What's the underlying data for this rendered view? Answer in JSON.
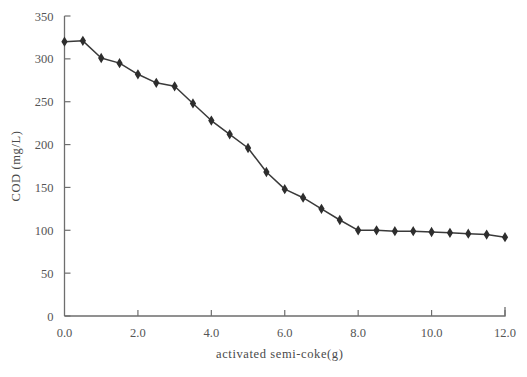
{
  "chart_data": {
    "type": "line",
    "title": "",
    "xlabel": "activated semi-coke(g)",
    "ylabel": "COD (mg/L)",
    "xlim": [
      0.0,
      12.0
    ],
    "ylim": [
      0,
      350
    ],
    "xticks": [
      "0.0",
      "2.0",
      "4.0",
      "6.0",
      "8.0",
      "10.0",
      "12.0"
    ],
    "xtick_values": [
      0.0,
      2.0,
      4.0,
      6.0,
      8.0,
      10.0,
      12.0
    ],
    "yticks": [
      "0",
      "50",
      "100",
      "150",
      "200",
      "250",
      "300",
      "350"
    ],
    "ytick_values": [
      0,
      50,
      100,
      150,
      200,
      250,
      300,
      350
    ],
    "grid": false,
    "legend": "none",
    "marker": "diamond",
    "line_color": "#3a3a3a",
    "marker_color": "#2e2e2e",
    "axis_color": "#6e6e6e",
    "x": [
      0.0,
      0.5,
      1.0,
      1.5,
      2.0,
      2.5,
      3.0,
      3.5,
      4.0,
      4.5,
      5.0,
      5.5,
      6.0,
      6.5,
      7.0,
      7.5,
      8.0,
      8.5,
      9.0,
      9.5,
      10.0,
      10.5,
      11.0,
      11.5,
      12.0
    ],
    "y": [
      320,
      321,
      301,
      295,
      282,
      272,
      268,
      248,
      228,
      212,
      196,
      168,
      148,
      138,
      125,
      112,
      100,
      100,
      99,
      99,
      98,
      97,
      96,
      95,
      92
    ],
    "series": [
      {
        "name": "COD",
        "values": [
          320,
          321,
          301,
          295,
          282,
          272,
          268,
          248,
          228,
          212,
          196,
          168,
          148,
          138,
          125,
          112,
          100,
          100,
          99,
          99,
          98,
          97,
          96,
          95,
          92
        ]
      }
    ]
  }
}
